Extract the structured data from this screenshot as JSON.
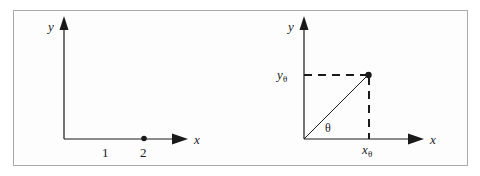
{
  "figure": {
    "background_color": "#fdfdfd",
    "border_color": "#a9a9a9",
    "stroke_color": "#1a1a1a",
    "panels": [
      {
        "id": "left-panel",
        "name": "number-line-axes-panel",
        "y_axis_label": "y",
        "x_axis_label": "x",
        "tick_labels": [
          "1",
          "2"
        ],
        "point_label": "2",
        "point_marker": "filled-dot"
      },
      {
        "id": "right-panel",
        "name": "polar-projection-panel",
        "y_axis_label": "y",
        "x_axis_label": "x",
        "y_component_base": "y",
        "y_component_sub": "θ",
        "x_component_base": "x",
        "x_component_sub": "θ",
        "angle_label": "θ",
        "point_marker": "filled-dot",
        "guide_style": "dashed",
        "ray_style": "solid"
      }
    ]
  }
}
